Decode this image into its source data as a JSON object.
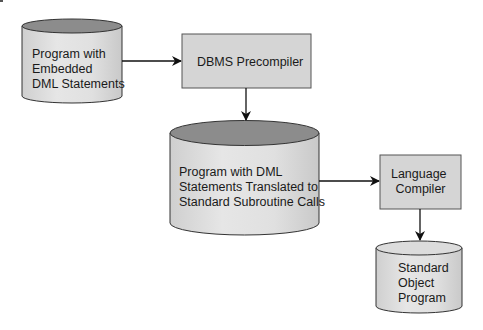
{
  "diagram": {
    "type": "flowchart",
    "nodes": [
      {
        "id": "source",
        "shape": "cylinder",
        "lines": [
          "Program with",
          "Embedded",
          "DML Statements"
        ]
      },
      {
        "id": "precompiler",
        "shape": "box",
        "lines": [
          "DBMS Precompiler"
        ]
      },
      {
        "id": "translated",
        "shape": "cylinder",
        "lines": [
          "Program with DML",
          "Statements Translated to",
          "Standard Subroutine Calls"
        ]
      },
      {
        "id": "compiler",
        "shape": "box",
        "lines": [
          "Language",
          "Compiler"
        ]
      },
      {
        "id": "object",
        "shape": "cylinder",
        "lines": [
          "Standard",
          "Object",
          "Program"
        ]
      }
    ],
    "edges": [
      {
        "from": "source",
        "to": "precompiler"
      },
      {
        "from": "precompiler",
        "to": "translated"
      },
      {
        "from": "translated",
        "to": "compiler"
      },
      {
        "from": "compiler",
        "to": "object"
      }
    ],
    "colors": {
      "box_fill": "#d5d5d5",
      "cylinder_top_dark": "#8c8c8c",
      "cylinder_top_light": "#dcdcdc",
      "cylinder_body": "#e2e2e2",
      "stroke": "#333333"
    }
  }
}
